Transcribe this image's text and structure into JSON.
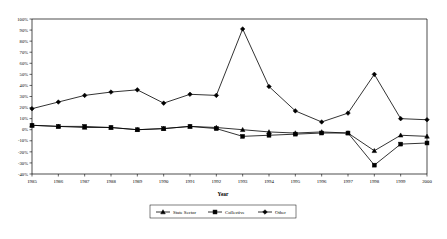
{
  "chart_data": {
    "type": "line",
    "title": "",
    "xlabel": "Year",
    "ylabel": "",
    "categories": [
      "1985",
      "1986",
      "1987",
      "1988",
      "1989",
      "1990",
      "1991",
      "1992",
      "1993",
      "1994",
      "1995",
      "1996",
      "1997",
      "1998",
      "1999",
      "2000"
    ],
    "x": [
      1985,
      1986,
      1987,
      1988,
      1989,
      1990,
      1991,
      1992,
      1993,
      1994,
      1995,
      1996,
      1997,
      1998,
      1999,
      2000
    ],
    "ylim": [
      -40,
      100
    ],
    "ytick_labels": [
      "100%",
      "90%",
      "80%",
      "70%",
      "60%",
      "50%",
      "40%",
      "30%",
      "20%",
      "10%",
      "0%",
      "-10%",
      "-20%",
      "-30%",
      "-40%"
    ],
    "ytick_values": [
      100,
      90,
      80,
      70,
      60,
      50,
      40,
      30,
      20,
      10,
      0,
      -10,
      -20,
      -30,
      -40
    ],
    "grid": false,
    "legend_position": "bottom",
    "series": [
      {
        "name": "State Sector",
        "marker": "triangle",
        "values": [
          4,
          3,
          2,
          2,
          0,
          1,
          3,
          2,
          0,
          -2,
          -3,
          -2,
          -3,
          -19,
          -5,
          -6
        ]
      },
      {
        "name": "Collective",
        "marker": "square",
        "values": [
          4,
          3,
          3,
          2,
          0,
          1,
          3,
          1,
          -6,
          -5,
          -4,
          -3,
          -3,
          -32,
          -13,
          -12
        ]
      },
      {
        "name": "Other",
        "marker": "diamond",
        "values": [
          19,
          25,
          31,
          34,
          36,
          24,
          32,
          31,
          91,
          39,
          17,
          7,
          15,
          50,
          10,
          9
        ]
      }
    ]
  },
  "legend": {
    "entries": [
      {
        "label": "State Sector"
      },
      {
        "label": "Collective"
      },
      {
        "label": "Other"
      }
    ]
  },
  "axis": {
    "x_title": "Year"
  }
}
